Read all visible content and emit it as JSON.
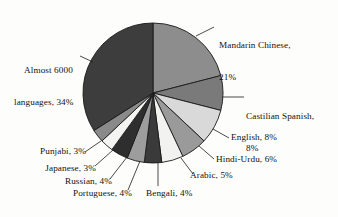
{
  "chart_data": {
    "type": "pie",
    "title": "",
    "subtitle": "",
    "xlabel": "",
    "ylabel": "",
    "legend_position": "none",
    "grid": false,
    "units": "%",
    "categories": [
      "Mandarin Chinese",
      "Castilian Spanish",
      "English",
      "Hindi-Urdu",
      "Arabic",
      "Bengali",
      "Portuguese",
      "Russian",
      "Japanese",
      "Punjabi",
      "Almost 6000 languages"
    ],
    "values": [
      21,
      8,
      8,
      6,
      5,
      4,
      4,
      4,
      3,
      3,
      34
    ],
    "slices": [
      {
        "label": "Mandarin Chinese",
        "value": 21,
        "label_text": "Mandarin Chinese,",
        "value_text": "21%",
        "color": "#8d8d8d"
      },
      {
        "label": "Castilian Spanish",
        "value": 8,
        "label_text": "Castilian Spanish,",
        "value_text": "8%",
        "color": "#7a7a7a"
      },
      {
        "label": "English",
        "value": 8,
        "label_text": "English, 8%",
        "value_text": "8%",
        "color": "#d9d9d9"
      },
      {
        "label": "Hindi-Urdu",
        "value": 6,
        "label_text": "Hindi-Urdu, 6%",
        "value_text": "6%",
        "color": "#9a9a9a"
      },
      {
        "label": "Arabic",
        "value": 5,
        "label_text": "Arabic, 5%",
        "value_text": "5%",
        "color": "#f2f2f0"
      },
      {
        "label": "Bengali",
        "value": 4,
        "label_text": "Bengali, 4%",
        "value_text": "4%",
        "color": "#3a3a3a"
      },
      {
        "label": "Portuguese",
        "value": 4,
        "label_text": "Portuguese, 4%",
        "value_text": "4%",
        "color": "#9d9d9d"
      },
      {
        "label": "Russian",
        "value": 4,
        "label_text": "Russian, 4%",
        "value_text": "4%",
        "color": "#2e2e2e"
      },
      {
        "label": "Japanese",
        "value": 3,
        "label_text": "Japanese, 3%",
        "value_text": "3%",
        "color": "#f4f4f2"
      },
      {
        "label": "Punjabi",
        "value": 3,
        "label_text": "Punjabi, 3%",
        "value_text": "3%",
        "color": "#8a8a8a"
      },
      {
        "label": "Almost 6000 languages",
        "value": 34,
        "label_text": "Almost 6000\nlanguages, 34%",
        "value_text": "34%",
        "color": "#3d3d3d"
      }
    ],
    "colors": {
      "outline": "#1a1a1a",
      "background": "#fdfdfb",
      "text": "#121212"
    },
    "geometry": {
      "cx": 153,
      "cy": 93,
      "r": 70,
      "start_angle_deg": -90
    }
  },
  "labels": {
    "mandarin_line1": "Mandarin Chinese,",
    "mandarin_line2": "21%",
    "spanish_line1": "Castilian Spanish,",
    "spanish_line2": "8%",
    "english": "English, 8%",
    "hindi_urdu": "Hindi-Urdu, 6%",
    "arabic": "Arabic, 5%",
    "bengali": "Bengali, 4%",
    "portuguese": "Portuguese, 4%",
    "russian": "Russian, 4%",
    "japanese": "Japanese, 3%",
    "punjabi": "Punjabi, 3%",
    "other_line1": "Almost 6000",
    "other_line2": "languages, 34%"
  }
}
